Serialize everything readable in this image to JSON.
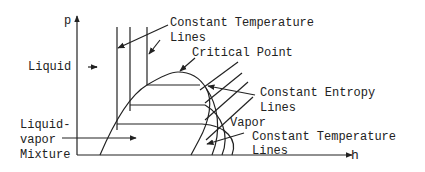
{
  "diagram": {
    "type": "pressure-enthalpy diagram",
    "axes": {
      "y_label": "p",
      "x_label": "h"
    },
    "labels": {
      "const_temp_top_line1": "Constant Temperature",
      "const_temp_top_line2": "Lines",
      "critical_point": "Critical Point",
      "liquid": "Liquid",
      "const_entropy_line1": "Constant Entropy",
      "const_entropy_line2": "Lines",
      "vapor": "Vapor",
      "mixture_line1": "Liquid-",
      "mixture_line2": "vapor",
      "mixture_line3": "Mixture",
      "const_temp_bottom_line1": "Constant Temperature",
      "const_temp_bottom_line2": "Lines"
    },
    "stroke_color": "#222222"
  }
}
